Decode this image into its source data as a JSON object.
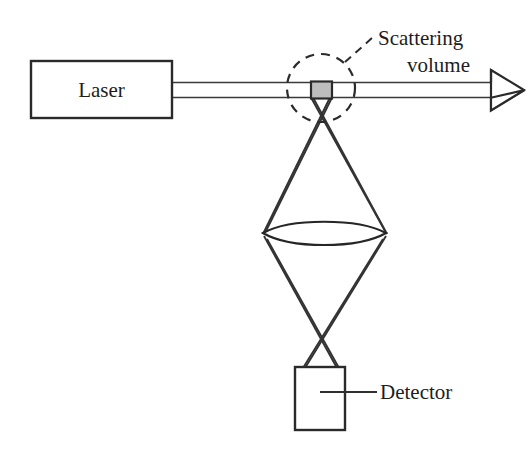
{
  "figure": {
    "background_color": "#ffffff",
    "line_color": "#2a2a2a",
    "scattering_volume_color": "#bdbdbd"
  },
  "labels": {
    "laser": "Laser",
    "scattering_volume_line1": "Scattering",
    "scattering_volume_line2": "volume",
    "detector": "Detector"
  },
  "components": [
    {
      "name": "laser-source-box",
      "label": "Laser"
    },
    {
      "name": "laser-beam",
      "label": ""
    },
    {
      "name": "scattering-volume",
      "label": "Scattering volume"
    },
    {
      "name": "collection-lens",
      "label": ""
    },
    {
      "name": "detector-box",
      "label": "Detector"
    },
    {
      "name": "beam-direction-arrow",
      "label": ""
    }
  ]
}
